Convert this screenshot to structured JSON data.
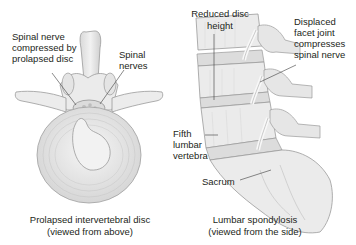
{
  "figure": {
    "left_panel": {
      "labels": {
        "compressed_nerve": [
          "Spinal nerve",
          "compressed by",
          "prolapsed disc"
        ],
        "spinal_nerves": [
          "Spinal",
          "nerves"
        ]
      },
      "caption": [
        "Prolapsed intervertebral disc",
        "(viewed from above)"
      ]
    },
    "right_panel": {
      "labels": {
        "reduced_disc_height": [
          "Reduced disc",
          "height"
        ],
        "displaced_facet": [
          "Displaced",
          "facet joint",
          "compresses",
          "spinal nerve"
        ],
        "fifth_lumbar": [
          "Fifth",
          "lumbar",
          "vertebra"
        ],
        "sacrum": [
          "Sacrum"
        ]
      },
      "caption": [
        "Lumbar spondylosis",
        "(viewed from the side)"
      ]
    }
  },
  "colors": {
    "bone_fill": "#ececec",
    "bone_stroke": "#9a9a9a",
    "shade": "#c8c8c8",
    "text": "#231f20",
    "leader_line": "#3a3a3a"
  }
}
